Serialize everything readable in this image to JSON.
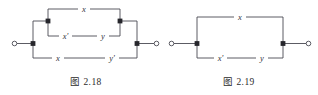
{
  "page": {
    "background": "#ffffff",
    "ink": "#3a3a42",
    "caption_color": "#2b2b2b"
  },
  "figures": [
    {
      "id": "fig-2-18",
      "caption": "图 2.18",
      "type": "switching-network-diagram",
      "description": "series-parallel contact network",
      "terminals": [
        {
          "name": "left-terminal",
          "symbol": "open-circle"
        },
        {
          "name": "right-terminal",
          "symbol": "open-circle"
        }
      ],
      "nodes": [
        {
          "name": "left-junction",
          "symbol": "filled-square"
        },
        {
          "name": "right-junction",
          "symbol": "filled-square"
        },
        {
          "name": "inner-top-left-node",
          "symbol": "filled-square"
        },
        {
          "name": "inner-top-right-node",
          "symbol": "filled-square"
        }
      ],
      "branches": [
        {
          "name": "top-branch",
          "labels": [
            "x"
          ]
        },
        {
          "name": "middle-branch",
          "labels": [
            "x'",
            "y"
          ]
        },
        {
          "name": "bottom-branch",
          "labels": [
            "x",
            "y'"
          ]
        }
      ]
    },
    {
      "id": "fig-2-19",
      "caption": "图 2.19",
      "type": "switching-network-diagram",
      "description": "two-branch parallel contact network",
      "terminals": [
        {
          "name": "left-terminal",
          "symbol": "open-circle"
        },
        {
          "name": "right-terminal",
          "symbol": "open-circle"
        }
      ],
      "nodes": [
        {
          "name": "left-junction",
          "symbol": "filled-square"
        },
        {
          "name": "right-junction",
          "symbol": "filled-square"
        }
      ],
      "branches": [
        {
          "name": "top-branch",
          "labels": [
            "x"
          ]
        },
        {
          "name": "bottom-branch",
          "labels": [
            "x'",
            "y"
          ]
        }
      ]
    }
  ],
  "labels": {
    "f18_top_x": "x",
    "f18_mid_xp": "x'",
    "f18_mid_y": "y",
    "f18_bot_x": "x",
    "f18_bot_yp": "y'",
    "f19_top_x": "x",
    "f19_bot_xp": "x'",
    "f19_bot_y": "y"
  },
  "captions": {
    "fig18": "图 2.18",
    "fig19": "图 2.19"
  }
}
